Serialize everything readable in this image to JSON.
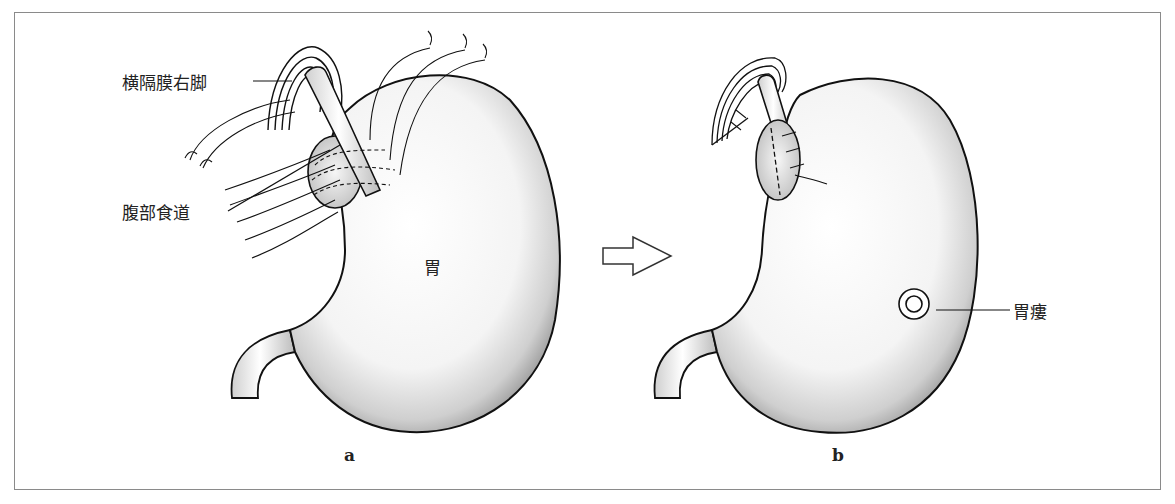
{
  "figure": {
    "panel_a": {
      "letter": "a",
      "labels": {
        "crus": "横隔膜右脚",
        "esophagus": "腹部食道",
        "stomach": "胃"
      }
    },
    "panel_b": {
      "letter": "b",
      "labels": {
        "gastrostomy": "胃瘻"
      }
    },
    "transition_arrow": "right-outline-arrow"
  }
}
